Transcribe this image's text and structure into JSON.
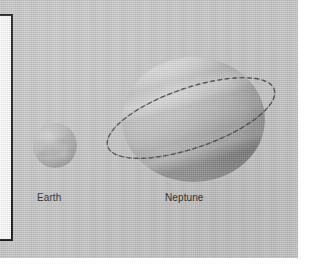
{
  "figure": {
    "kind": "planet-size-comparison-photo",
    "background_color": "#c9c9c9",
    "page_color": "#ffffff",
    "frame_border_color": "#141414",
    "frame_fill_color": "#fdfdfd"
  },
  "bodies": [
    {
      "id": "earth",
      "label": "Earth",
      "shape": "sphere",
      "surface": "mottled",
      "color": "#b8b8b8"
    },
    {
      "id": "neptune",
      "label": "Neptune",
      "shape": "sphere",
      "surface": "banded",
      "color": "#c1c1c1",
      "ring": {
        "style": "dashed-ellipse",
        "color": "#4a4a4a"
      }
    }
  ]
}
